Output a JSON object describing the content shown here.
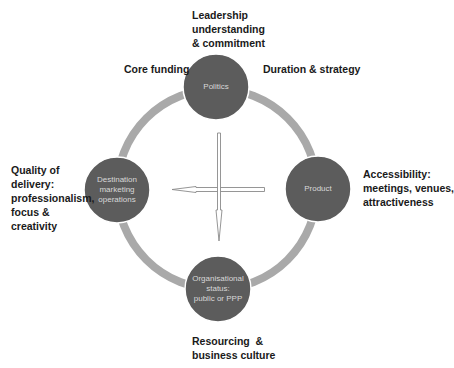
{
  "diagram": {
    "ring": {
      "cx": 217,
      "cy": 189,
      "r": 100,
      "stroke": "#a9a9a9",
      "width": 8
    },
    "node_fill": "#5c5c5c",
    "node_text_color": "#d8d8d8",
    "nodes": {
      "top": {
        "lines": [
          "Politics"
        ]
      },
      "right": {
        "lines": [
          "Product"
        ]
      },
      "left": {
        "lines": [
          "Destination",
          "marketing",
          "operations"
        ]
      },
      "bottom": {
        "lines": [
          "Organisational",
          "status:",
          "public or PPP"
        ]
      }
    },
    "labels": {
      "top": {
        "lines": [
          "Leadership",
          "understanding",
          "& commitment"
        ]
      },
      "top_left": {
        "lines": [
          "Core funding"
        ]
      },
      "top_right": {
        "lines": [
          "Duration & strategy"
        ]
      },
      "left": {
        "lines": [
          "Quality of",
          "delivery:",
          "professionalism,",
          "focus &",
          "creativity"
        ]
      },
      "right": {
        "lines": [
          "Accessibility:",
          "meetings, venues,",
          "attractiveness"
        ]
      },
      "bottom": {
        "lines": [
          "Resourcing  &",
          "business culture"
        ]
      }
    },
    "arrows": [
      {
        "direction": "down",
        "from": [
          219,
          133
        ],
        "to": [
          219,
          240
        ]
      },
      {
        "direction": "left",
        "from": [
          265,
          189
        ],
        "to": [
          172,
          189
        ]
      }
    ]
  }
}
